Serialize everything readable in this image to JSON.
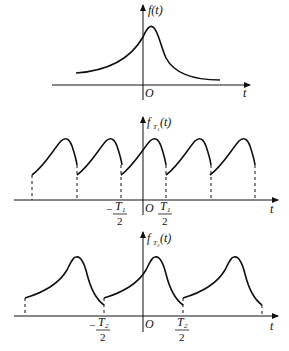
{
  "figure": {
    "panels": [
      {
        "id": "original",
        "ylabel": "f(t)",
        "xlabel": "t",
        "origin_label": "O"
      },
      {
        "id": "periodic_T1",
        "ylabel_main": "f",
        "ylabel_sub": "T",
        "ylabel_subsub": "1",
        "ylabel_tail": "(t)",
        "xlabel": "t",
        "origin_label": "O",
        "tick_left_num": "T",
        "tick_left_sub": "1",
        "tick_left_sign": "−",
        "tick_right_num": "T",
        "tick_right_sub": "1",
        "tick_den": "2"
      },
      {
        "id": "periodic_T2",
        "ylabel_main": "f",
        "ylabel_sub": "T",
        "ylabel_subsub": "2",
        "ylabel_tail": "(t)",
        "xlabel": "t",
        "origin_label": "O",
        "tick_left_num": "T",
        "tick_left_sub": "2",
        "tick_left_sign": "−",
        "tick_right_num": "T",
        "tick_right_sub": "2",
        "tick_den": "2"
      }
    ],
    "colors": {
      "line": "#111111",
      "background": "#ffffff"
    }
  }
}
